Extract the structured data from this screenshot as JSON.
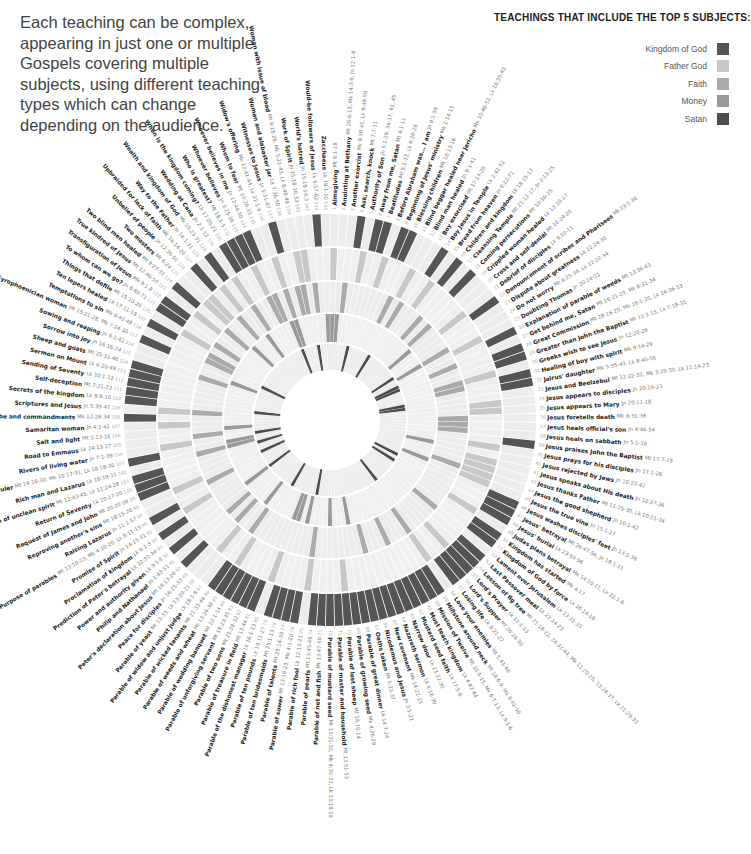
{
  "intro_text": "Each teaching can be complex, appearing in just one or multiple Gospels covering multiple subjects, using different teaching types which can change depending on the audience.",
  "legend": {
    "title": "TEACHINGS THAT INCLUDE THE TOP 5 SUBJECTS:",
    "items": [
      {
        "label": "Kingdom of God",
        "color": "#555555"
      },
      {
        "label": "Father God",
        "color": "#c8c8c8"
      },
      {
        "label": "Faith",
        "color": "#aaaaaa"
      },
      {
        "label": "Money",
        "color": "#999999"
      },
      {
        "label": "Satan",
        "color": "#4d4d4d"
      }
    ]
  },
  "chart_data": {
    "type": "radial-heatmap",
    "title": "Teachings that include the top 5 subjects",
    "rings_outer_to_inner": [
      "Kingdom of God",
      "Father God",
      "Faith",
      "Money",
      "Satan"
    ],
    "center": [
      330,
      420
    ],
    "teachings": [
      {
        "n": 1,
        "name": "Almsgiving",
        "ref": "Mt 6:1-18"
      },
      {
        "n": 2,
        "name": "Anointing at Bethany",
        "ref": "Mt 26:6-13, Mk 14:3-9, Jn 12:1-8"
      },
      {
        "n": 3,
        "name": "Another exorcist",
        "ref": "Mk 9:38-41, Lk 9:49-50"
      },
      {
        "n": 4,
        "name": "Ask, search, knock",
        "ref": "Mt 7:7-11"
      },
      {
        "n": 5,
        "name": "Authority of Son",
        "ref": "Jn 5:1-29, 36-37, 43, 45"
      },
      {
        "n": 6,
        "name": "Away from me, Satan",
        "ref": "Mt 4:1-11"
      },
      {
        "n": 7,
        "name": "Beatitudes",
        "ref": "Mt 5:1-12, Lk 6:20-26"
      },
      {
        "n": 8,
        "name": "Before Abraham was... I am",
        "ref": "Jn 8:1-59"
      },
      {
        "n": 9,
        "name": "Beginning of Jesus' ministry",
        "ref": "Mk 1:14-15"
      },
      {
        "n": 10,
        "name": "Blessing children",
        "ref": "Mk 10:13-16"
      },
      {
        "n": 11,
        "name": "Blind beggar healed near Jericho",
        "ref": "Mk 10:46-52, Lk 18:35-43"
      },
      {
        "n": 12,
        "name": "Blind man healed",
        "ref": "Jn 9:1-41"
      },
      {
        "n": 13,
        "name": "Boy exorcised",
        "ref": "Mt 17:14-20"
      },
      {
        "n": 14,
        "name": "Boy Jesus in Temple",
        "ref": "Lk 2:41-52"
      },
      {
        "n": 15,
        "name": "Bread from heaven",
        "ref": "Jn 6:22-71"
      },
      {
        "n": 16,
        "name": "Children and kingdom",
        "ref": "Lk 18:15-17"
      },
      {
        "n": 17,
        "name": "Cleansing Temple",
        "ref": "Mt 21:12-17, Jn 2:13-25"
      },
      {
        "n": 18,
        "name": "Coming persecutions",
        "ref": "Mt 10:16-25"
      },
      {
        "n": 19,
        "name": "Crippled woman healed",
        "ref": "Lk 13:10-17"
      },
      {
        "n": 20,
        "name": "Cross and self-denial",
        "ref": "Mt 16:24-28"
      },
      {
        "n": 21,
        "name": "Debrief of disciples",
        "ref": "Lk 9:10-11"
      },
      {
        "n": 22,
        "name": "Denouncement of scribes and Pharisees",
        "ref": "Mt 23:1-36"
      },
      {
        "n": 23,
        "name": "Dispute about greatness",
        "ref": "Lk 22:24-30"
      },
      {
        "n": 24,
        "name": "Do not worry",
        "ref": "Mt 6:25-34, Lk 12:22-34"
      },
      {
        "n": 25,
        "name": "Doubting Thomas",
        "ref": "Jn 20:24-31"
      },
      {
        "n": 26,
        "name": "Explanation of parable of weeds",
        "ref": "Mt 13:36-43"
      },
      {
        "n": 27,
        "name": "Get behind me, Satan",
        "ref": "Mt 16:21-23, Mk 8:31-34"
      },
      {
        "n": 28,
        "name": "Great Commission",
        "ref": "Mt 28:16-20, Mk 16:1-20, Lk 24:36-53"
      },
      {
        "n": 29,
        "name": "Greater than John the Baptist",
        "ref": "Mt 11:1-15, Lk 7:18-35"
      },
      {
        "n": 30,
        "name": "Greeks wish to see Jesus",
        "ref": "Jn 12:20-26"
      },
      {
        "n": 31,
        "name": "Healing of boy with spirit",
        "ref": "Mk 9:14-29"
      },
      {
        "n": 32,
        "name": "Jairus' daughter",
        "ref": "Mk 5:35-43, Lk 8:40-56"
      },
      {
        "n": 33,
        "name": "Jesus and Beelzebul",
        "ref": "Mt 12:22-32, Mk 3:20-30, Lk 11:14-23"
      },
      {
        "n": 34,
        "name": "Jesus appears to disciples",
        "ref": "Jn 20:19-23"
      },
      {
        "n": 35,
        "name": "Jesus appears to Mary",
        "ref": "Jn 20:11-18"
      },
      {
        "n": 36,
        "name": "Jesus foretells death",
        "ref": "Mk 8:31-38"
      },
      {
        "n": 37,
        "name": "Jesus heals official's son",
        "ref": "Jn 4:46-54"
      },
      {
        "n": 38,
        "name": "Jesus heals on sabbath",
        "ref": "Jn 5:1-18"
      },
      {
        "n": 39,
        "name": "Jesus praises John the Baptist",
        "ref": "Mt 11:7-19"
      },
      {
        "n": 40,
        "name": "Jesus prays for his disciples",
        "ref": "Jn 17:1-26"
      },
      {
        "n": 41,
        "name": "Jesus rejected by Jews",
        "ref": "Jn 10:22-42"
      },
      {
        "n": 42,
        "name": "Jesus speaks about His death",
        "ref": "Jn 12:27-36"
      },
      {
        "n": 43,
        "name": "Jesus thanks Father",
        "ref": "Mt 11:25-30, Lk 10:21-24"
      },
      {
        "n": 44,
        "name": "Jesus the good shepherd",
        "ref": "Jn 10:1-42"
      },
      {
        "n": 45,
        "name": "Jesus the true vine",
        "ref": "Jn 15:1-27"
      },
      {
        "n": 46,
        "name": "Jesus washes disciples' feet",
        "ref": "Jn 13:1-38"
      },
      {
        "n": 47,
        "name": "Jesus' betrayal",
        "ref": "Mt 26:47-56, Jn 18:1-11"
      },
      {
        "n": 48,
        "name": "Jesus' burial",
        "ref": "Lk 23:50-56"
      },
      {
        "n": 49,
        "name": "Judas plans betrayal",
        "ref": "Mk 14:10-11, Lk 22:1-6"
      },
      {
        "n": 50,
        "name": "Kingdom has started",
        "ref": "Mk 4:17"
      },
      {
        "n": 51,
        "name": "Kingdom of God by force",
        "ref": "Lk 16:14-18"
      },
      {
        "n": 52,
        "name": "Lament over Jerusalem",
        "ref": "Lk 13:31-35"
      },
      {
        "n": 53,
        "name": "Last Passover meal",
        "ref": "Lk 22:14-23"
      },
      {
        "n": 54,
        "name": "Lesson of fig tree",
        "ref": "Mt 21:18-22, 24:32-44, Mk 11:20-25, 13:28-37, Lk 21:29-33"
      },
      {
        "n": 55,
        "name": "Lord's Prayer",
        "ref": "Lk 11:1-13"
      },
      {
        "n": 56,
        "name": "Lord's Supper",
        "ref": "Mt 26:26-30"
      },
      {
        "n": 57,
        "name": "Losing life",
        "ref": "Lk 9:21-27"
      },
      {
        "n": 58,
        "name": "Love your enemies",
        "ref": "Mt 5:43-48"
      },
      {
        "n": 59,
        "name": "Millstone around neck",
        "ref": "Mt 18:6-9, Mk 9:42-50"
      },
      {
        "n": 60,
        "name": "Mission of Twelve",
        "ref": "Mt 10:5-15, Mk 6:7-13, Lk 9:1-6"
      },
      {
        "n": 61,
        "name": "Must teach kingdom",
        "ref": "Lk 4:42-44"
      },
      {
        "n": 62,
        "name": "Mustard seed faith",
        "ref": "Lk 17:5-6"
      },
      {
        "n": 63,
        "name": "Narrow door",
        "ref": "Lk 13:22-30"
      },
      {
        "n": 64,
        "name": "Nazareth sermon",
        "ref": "Lk 4:16-30"
      },
      {
        "n": 65,
        "name": "New covenant",
        "ref": "Mk 14:22-25"
      },
      {
        "n": 66,
        "name": "Nicodemus and Jesus",
        "ref": "Jn 3:1-21"
      },
      {
        "n": 67,
        "name": "Oaths taken",
        "ref": "Mt 5:33-37"
      },
      {
        "n": 68,
        "name": "Parable of great dinner",
        "ref": "Lk 14:7-24"
      },
      {
        "n": 69,
        "name": "Parable of growing seed",
        "ref": "Mk 4:26-29"
      },
      {
        "n": 70,
        "name": "Parable of lost sheep",
        "ref": "Mt 18:10-14"
      },
      {
        "n": 71,
        "name": "Parable of master and household",
        "ref": "Mt 13:51-53"
      },
      {
        "n": 72,
        "name": "Parable of mustard seed",
        "ref": "Mt 13:31-32, Mk 4:30-32, Lk 13:18-19"
      },
      {
        "n": 73,
        "name": "Parable of net and fish",
        "ref": "Mt 13:47-50"
      },
      {
        "n": 74,
        "name": "Parable of pearls",
        "ref": "Mt 13:45-46"
      },
      {
        "n": 75,
        "name": "Parable of rich fool",
        "ref": "Lk 12:13-21"
      },
      {
        "n": 76,
        "name": "Parable of sower",
        "ref": "Mt 13:18-23, Mk 4:1-20"
      },
      {
        "n": 77,
        "name": "Parable of talents",
        "ref": "Mt 25:14-30"
      },
      {
        "n": 78,
        "name": "Parable of ten bridesmaids",
        "ref": "Mt 25:1-13"
      },
      {
        "n": 79,
        "name": "Parable of ten pounds",
        "ref": "Lk 19:11-27"
      },
      {
        "n": 80,
        "name": "Parable of the dishonest manager",
        "ref": "Lk 16:1-13"
      },
      {
        "n": 81,
        "name": "Parable of treasure in field",
        "ref": "Mt 13:44"
      },
      {
        "n": 82,
        "name": "Parable of two sons",
        "ref": "Mt 21:28-32"
      },
      {
        "n": 83,
        "name": "Parable of unforgiving servant",
        "ref": "Mt 18:23-35"
      },
      {
        "n": 84,
        "name": "Parable of wedding banquet",
        "ref": "Mt 22:1-14"
      },
      {
        "n": 85,
        "name": "Parable of weeds and wheat",
        "ref": "Mt 13:24-30"
      },
      {
        "n": 86,
        "name": "Parable of wicked tenants",
        "ref": "Mt 21:33-46"
      },
      {
        "n": 87,
        "name": "Parable of widow and unjust judge",
        "ref": "Lk 18:1-8"
      },
      {
        "n": 88,
        "name": "Parable of yeast",
        "ref": "Mt 13:33, Lk 13:20-21"
      },
      {
        "n": 89,
        "name": "Peace for disciples",
        "ref": "Jn 16:25-33"
      },
      {
        "n": 90,
        "name": "Peter's declaration about Jesus",
        "ref": "Mt 16:13-20"
      },
      {
        "n": 91,
        "name": "Philip and Nathanael",
        "ref": "Jn 1:43-51"
      },
      {
        "n": 92,
        "name": "Power and authority given",
        "ref": "Lk 9:1-6"
      },
      {
        "n": 93,
        "name": "Prediction of Peter's betrayal",
        "ref": "Lk 22:31-34"
      },
      {
        "n": 94,
        "name": "Proclamation of kingdom",
        "ref": "Lk 8:1-3"
      },
      {
        "n": 95,
        "name": "Promise of Spirit",
        "ref": "Jn 14:15-31"
      },
      {
        "n": 96,
        "name": "Purpose of parables",
        "ref": "Mt 13:10-23, Mk 4:10-20, Lk 8:11-15"
      },
      {
        "n": 97,
        "name": "Raising Lazarus",
        "ref": "Jn 11:1-57"
      },
      {
        "n": 98,
        "name": "Reproving another's sins",
        "ref": "Mt 18:15-20"
      },
      {
        "n": 99,
        "name": "Request of James and John",
        "ref": "Mt 20:20-28"
      },
      {
        "n": 100,
        "name": "Return of Seventy",
        "ref": "Lk 10:17-20"
      },
      {
        "n": 101,
        "name": "Return of unclean spirit",
        "ref": "Mt 12:43-45, Lk 11:24-26"
      },
      {
        "n": 102,
        "name": "Rich man and Lazarus",
        "ref": "Lk 16:19-31"
      },
      {
        "n": 103,
        "name": "Rich young ruler",
        "ref": "Mt 19:16-30, Mk 10:17-31, Lk 18:18-30"
      },
      {
        "n": 104,
        "name": "Rivers of living water",
        "ref": "Jn 7:1-39"
      },
      {
        "n": 105,
        "name": "Road to Emmaus",
        "ref": "Lk 24:13-27"
      },
      {
        "n": 106,
        "name": "Salt and light",
        "ref": "Mt 5:13-16"
      },
      {
        "n": 107,
        "name": "Samaritan woman",
        "ref": "Jn 4:1-42"
      },
      {
        "n": 108,
        "name": "Scribe and commandments",
        "ref": "Mk 12:28-34"
      },
      {
        "n": 109,
        "name": "Scriptures and Jesus",
        "ref": "Jn 5:39-47"
      },
      {
        "n": 110,
        "name": "Secrets of the kingdom",
        "ref": "Lk 8:9-10"
      },
      {
        "n": 111,
        "name": "Self-deception",
        "ref": "Mt 7:21-23"
      },
      {
        "n": 112,
        "name": "Sending of Seventy",
        "ref": "Lk 10:1-12"
      },
      {
        "n": 113,
        "name": "Sermon on Mount",
        "ref": "Lk 6:20-49"
      },
      {
        "n": 114,
        "name": "Sheep and goats",
        "ref": "Mt 25:31-46"
      },
      {
        "n": 115,
        "name": "Sorrow into joy",
        "ref": "Jn 16:16-24"
      },
      {
        "n": 116,
        "name": "Sowing and reaping",
        "ref": "Jn 4:1-42"
      },
      {
        "n": 117,
        "name": "Syrophoenician woman",
        "ref": "Mt 15:21-28, Mk 7:24-30"
      },
      {
        "n": 118,
        "name": "Temptations to sin",
        "ref": "Mk 9:42-48"
      },
      {
        "n": 119,
        "name": "Ten lepers healed",
        "ref": "Lk 17:11-19"
      },
      {
        "n": 120,
        "name": "Things that defile",
        "ref": "Mt 15:10-20"
      },
      {
        "n": 121,
        "name": "To whom can we go?",
        "ref": "Jn 6:60-71"
      },
      {
        "n": 122,
        "name": "Transfiguration of Jesus",
        "ref": "Mk 9:1-8"
      },
      {
        "n": 123,
        "name": "True kindred of Jesus",
        "ref": "Mt 12:46-50"
      },
      {
        "n": 124,
        "name": "Two blind men healed",
        "ref": "Mt 9:27-31"
      },
      {
        "n": 125,
        "name": "Two masters",
        "ref": "Mt 6:24"
      },
      {
        "n": 126,
        "name": "Unbelief of people",
        "ref": "Jn 12:36-50"
      },
      {
        "n": 127,
        "name": "Upbraided for lack of faith",
        "ref": "Mk 16:14-20"
      },
      {
        "n": 128,
        "name": "Way to the Father",
        "ref": "Jn 14:1-31"
      },
      {
        "n": 129,
        "name": "Wealth and kingdom of God",
        "ref": "Mk 10:23-31"
      },
      {
        "n": 130,
        "name": "Wedding at Cana",
        "ref": "Jn 2:1-12"
      },
      {
        "n": 131,
        "name": "When is the kingdom coming?",
        "ref": "Lk 17:20-21"
      },
      {
        "n": 132,
        "name": "Who is greatest?",
        "ref": "Mt 18:1-5"
      },
      {
        "n": 133,
        "name": "Whoever believes",
        "ref": "Jn 3:25-36"
      },
      {
        "n": 134,
        "name": "Whoever believes in me",
        "ref": "Jn 12:44-50"
      },
      {
        "n": 135,
        "name": "Whom to fear",
        "ref": "Mt 10:26-33"
      },
      {
        "n": 136,
        "name": "Widow's offering",
        "ref": "Mk 12:41-44, Lk 21:1-4"
      },
      {
        "n": 137,
        "name": "Witnesses to Jesus",
        "ref": "Jn 5:31-47"
      },
      {
        "n": 138,
        "name": "Woman and alabaster jar",
        "ref": "Lk 7:36-50"
      },
      {
        "n": 139,
        "name": "Woman with issue of blood",
        "ref": "Mt 9:18-26, Mk 5:21-43, Lk 8:40-48"
      },
      {
        "n": 140,
        "name": "Work of Spirit",
        "ref": "Jn 15:18-16:33"
      },
      {
        "n": 141,
        "name": "World's hatred",
        "ref": "Jn 15:18-16:3"
      },
      {
        "n": 142,
        "name": "Would-be followers of Jesus",
        "ref": "Lk 9:57-62"
      },
      {
        "n": 143,
        "name": "Zacchaeus",
        "ref": "Lk 19:1-10"
      }
    ],
    "kingdom_of_god": [
      4,
      6,
      7,
      9,
      10,
      14,
      16,
      18,
      22,
      26,
      28,
      29,
      31,
      32,
      39,
      46,
      47,
      48,
      50,
      51,
      53,
      54,
      55,
      56,
      57,
      59,
      60,
      61,
      62,
      63,
      64,
      65,
      66,
      67,
      68,
      69,
      70,
      71,
      72,
      73,
      74,
      76,
      77,
      78,
      79,
      81,
      82,
      83,
      84,
      85,
      86,
      90,
      92,
      94,
      96,
      99,
      100,
      101,
      103,
      108,
      110,
      111,
      112,
      113,
      114,
      117,
      119,
      121,
      122,
      124,
      127,
      129,
      131,
      132,
      133,
      134,
      137,
      142
    ],
    "father_god": [
      1,
      5,
      8,
      12,
      15,
      21,
      25,
      30,
      34,
      35,
      40,
      42,
      43,
      44,
      45,
      49,
      55,
      58,
      70,
      75,
      80,
      85,
      88,
      95,
      98,
      104,
      107,
      109,
      120,
      123,
      125,
      126,
      128,
      130,
      133,
      136,
      139,
      140
    ],
    "faith": [
      3,
      11,
      13,
      17,
      19,
      24,
      27,
      30,
      31,
      36,
      37,
      38,
      44,
      52,
      58,
      62,
      66,
      75,
      86,
      89,
      91,
      97,
      102,
      105,
      109,
      115,
      118,
      119,
      121,
      124,
      127,
      130,
      133,
      134,
      136,
      138,
      139,
      141
    ],
    "money": [
      1,
      2,
      20,
      24,
      41,
      45,
      68,
      72,
      77,
      79,
      80,
      87,
      93,
      102,
      103,
      106,
      116,
      125,
      129,
      135,
      136,
      143
    ],
    "satan": [
      6,
      13,
      23,
      26,
      27,
      32,
      33,
      47,
      49,
      57,
      76,
      84,
      93,
      98,
      101,
      104,
      110,
      118,
      135,
      140
    ]
  }
}
